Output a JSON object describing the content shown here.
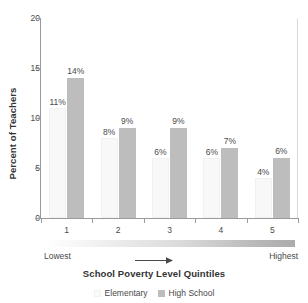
{
  "chart_data": {
    "type": "bar",
    "title": "",
    "xlabel": "School Poverty Level Quintiles",
    "ylabel": "Percent of Teachers",
    "categories": [
      "1",
      "2",
      "3",
      "4",
      "5"
    ],
    "series": [
      {
        "name": "Elementary",
        "color": "#f8f8f8",
        "values": [
          11,
          8,
          6,
          6,
          4
        ],
        "labels": [
          "11%",
          "8%",
          "6%",
          "6%",
          "4%"
        ]
      },
      {
        "name": "High School",
        "color": "#bdbdbd",
        "values": [
          14,
          9,
          9,
          7,
          6
        ],
        "labels": [
          "14%",
          "9%",
          "9%",
          "7%",
          "6%"
        ]
      }
    ],
    "ylim": [
      0,
      20
    ],
    "yticks": [
      0,
      5,
      10,
      15,
      20
    ],
    "ytick_labels": [
      "0",
      "5",
      "10",
      "15",
      "20"
    ],
    "grid": false,
    "legend_position": "bottom"
  },
  "axis": {
    "y_title": "Percent of Teachers",
    "x_title": "School Poverty Level Quintiles"
  },
  "scale": {
    "low_label": "Lowest",
    "high_label": "Highest",
    "arrow": "right-arrow-icon"
  },
  "legend": {
    "items": [
      {
        "label": "Elementary",
        "swatch": "legend-swatch-elementary"
      },
      {
        "label": "High School",
        "swatch": "legend-swatch-high-school"
      }
    ]
  }
}
